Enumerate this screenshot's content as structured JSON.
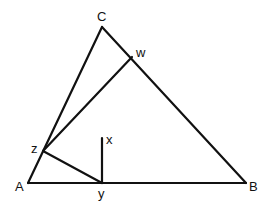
{
  "diagram": {
    "type": "geometry-triangle",
    "line_color": "#111111",
    "background": "#ffffff",
    "points": {
      "A": {
        "label": "A",
        "x": 28,
        "y": 183,
        "lx": 15,
        "ly": 191
      },
      "B": {
        "label": "B",
        "x": 246,
        "y": 183,
        "lx": 249,
        "ly": 191
      },
      "C": {
        "label": "C",
        "x": 102,
        "y": 27,
        "lx": 97,
        "ly": 21
      },
      "w": {
        "label": "w",
        "x": 132,
        "y": 57,
        "lx": 136,
        "ly": 57
      },
      "z": {
        "label": "z",
        "x": 43,
        "y": 151,
        "lx": 31,
        "ly": 153
      },
      "y": {
        "label": "y",
        "x": 102,
        "y": 183,
        "lx": 98,
        "ly": 198
      },
      "x": {
        "label": "x",
        "x": 102,
        "y": 138,
        "lx": 106,
        "ly": 144
      }
    },
    "segments": [
      {
        "from": "A",
        "to": "B"
      },
      {
        "from": "B",
        "to": "C"
      },
      {
        "from": "C",
        "to": "A"
      },
      {
        "from": "z",
        "to": "w"
      },
      {
        "from": "z",
        "to": "y"
      },
      {
        "from": "y",
        "to": "x"
      }
    ]
  }
}
